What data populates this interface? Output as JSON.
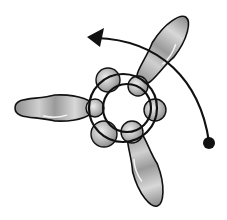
{
  "diagram": {
    "colors": {
      "bead_fill": "#a8a8a8",
      "bead_highlight": "#e6e6e6",
      "outline": "#111111",
      "background": "#ffffff"
    },
    "petals": [
      {
        "name": "left-petal",
        "cx": 55,
        "cy": 108,
        "rx": 40,
        "ry": 13,
        "rotate": 0
      },
      {
        "name": "upper-right-petal",
        "cx": 163,
        "cy": 50,
        "rx": 40,
        "ry": 13,
        "rotate": -55
      },
      {
        "name": "lower-petal",
        "cx": 145,
        "cy": 168,
        "rx": 40,
        "ry": 13,
        "rotate": 72
      }
    ],
    "round_beads": [
      {
        "cx": 108,
        "cy": 80,
        "r": 12
      },
      {
        "cx": 138,
        "cy": 86,
        "r": 10
      },
      {
        "cx": 155,
        "cy": 110,
        "r": 11
      },
      {
        "cx": 132,
        "cy": 132,
        "r": 11
      },
      {
        "cx": 104,
        "cy": 134,
        "r": 13
      },
      {
        "cx": 95,
        "cy": 108,
        "r": 9
      }
    ],
    "rings": [
      {
        "cx": 123,
        "cy": 108,
        "r": 34
      },
      {
        "cx": 127,
        "cy": 108,
        "r": 24
      }
    ],
    "thread": {
      "path": "M209,142 C200,80 160,40 96,38",
      "end_dot": {
        "cx": 209,
        "cy": 143,
        "r": 6
      },
      "arrowhead": "87,37 104,28 100,47"
    }
  }
}
